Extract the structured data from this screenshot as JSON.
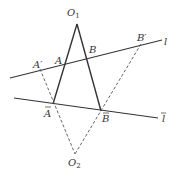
{
  "diagram": {
    "labels": {
      "O1": "O",
      "O1_sub": "1",
      "O2": "O",
      "O2_sub": "2",
      "A": "A",
      "B": "B",
      "A_prime": "A′",
      "B_prime": "B′",
      "A_bar": "A",
      "B_bar": "B",
      "line_l": "l",
      "line_l_bar": "l"
    },
    "colors": {
      "solid": "#333333",
      "dashed": "#555555"
    }
  }
}
